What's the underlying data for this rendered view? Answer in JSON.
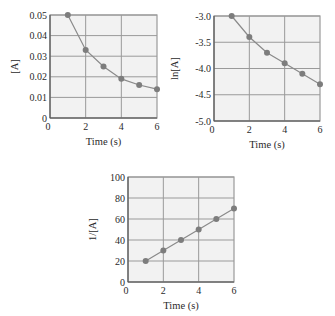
{
  "colors": {
    "plot_bg": "#f2f2f2",
    "grid": "#9a9a9a",
    "axis": "#555555",
    "line": "#8a8a8a",
    "marker": "#7d7d7d"
  },
  "chart_data": [
    {
      "type": "line",
      "title": "",
      "xlabel": "Time (s)",
      "ylabel": "[A]",
      "x": [
        1,
        2,
        3,
        4,
        5,
        6
      ],
      "series": [
        {
          "name": "[A]",
          "values": [
            0.05,
            0.033,
            0.025,
            0.019,
            0.016,
            0.014
          ]
        }
      ],
      "xlim": [
        0,
        6
      ],
      "ylim": [
        0,
        0.05
      ],
      "xticks": [
        "0",
        "2",
        "4",
        "6"
      ],
      "yticks": [
        "0",
        "0.01",
        "0.02",
        "0.03",
        "0.04",
        "0.05"
      ],
      "grid": true,
      "legend": "none"
    },
    {
      "type": "line",
      "title": "",
      "xlabel": "Time (s)",
      "ylabel": "ln[A]",
      "x": [
        1,
        2,
        3,
        4,
        5,
        6
      ],
      "series": [
        {
          "name": "ln[A]",
          "values": [
            -3.0,
            -3.4,
            -3.7,
            -3.9,
            -4.1,
            -4.3
          ]
        }
      ],
      "xlim": [
        0,
        6
      ],
      "ylim": [
        -5.0,
        -3.0
      ],
      "xticks": [
        "0",
        "2",
        "4",
        "6"
      ],
      "yticks": [
        "-5.0",
        "-4.5",
        "-4.0",
        "-3.5",
        "-3.0"
      ],
      "grid": true,
      "legend": "none"
    },
    {
      "type": "line",
      "title": "",
      "xlabel": "Time (s)",
      "ylabel": "1/[A]",
      "x": [
        1,
        2,
        3,
        4,
        5,
        6
      ],
      "series": [
        {
          "name": "1/[A]",
          "values": [
            20,
            30,
            40,
            50,
            60,
            70
          ]
        }
      ],
      "xlim": [
        0,
        6
      ],
      "ylim": [
        0,
        100
      ],
      "xticks": [
        "0",
        "2",
        "4",
        "6"
      ],
      "yticks": [
        "0",
        "20",
        "40",
        "60",
        "80",
        "100"
      ],
      "grid": true,
      "legend": "none"
    }
  ]
}
